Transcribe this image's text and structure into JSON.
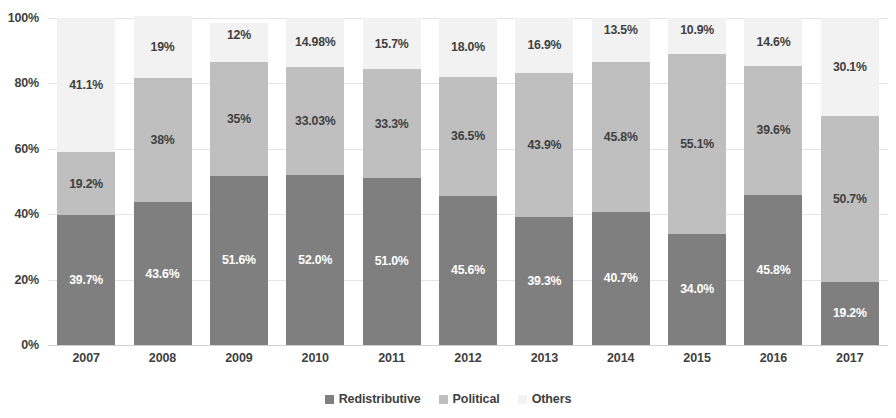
{
  "chart_data": {
    "type": "bar",
    "subtype": "100% stacked column",
    "title": "",
    "xlabel": "",
    "ylabel": "",
    "categories": [
      "2007",
      "2008",
      "2009",
      "2010",
      "2011",
      "2012",
      "2013",
      "2014",
      "2015",
      "2016",
      "2017"
    ],
    "ylim": [
      0,
      100
    ],
    "y_ticks": [
      0,
      20,
      40,
      60,
      80,
      100
    ],
    "y_tick_labels": [
      "0%",
      "20%",
      "40%",
      "60%",
      "80%",
      "100%"
    ],
    "grid": true,
    "legend_position": "bottom",
    "series": [
      {
        "name": "Redistributive",
        "color": "#7f7f7f",
        "values": [
          39.7,
          43.6,
          51.6,
          52.0,
          51.0,
          45.6,
          39.3,
          40.7,
          34.0,
          45.8,
          19.2
        ],
        "labels": [
          "39.7%",
          "43.6%",
          "51.6%",
          "52.0%",
          "51.0%",
          "45.6%",
          "39.3%",
          "40.7%",
          "34.0%",
          "45.8%",
          "19.2%"
        ]
      },
      {
        "name": "Political",
        "color": "#bfbfbf",
        "values": [
          19.2,
          38.0,
          35.0,
          33.03,
          33.3,
          36.5,
          43.9,
          45.8,
          55.1,
          39.6,
          50.7
        ],
        "labels": [
          "19.2%",
          "38%",
          "35%",
          "33.03%",
          "33.3%",
          "36.5%",
          "43.9%",
          "45.8%",
          "55.1%",
          "39.6%",
          "50.7%"
        ]
      },
      {
        "name": "Others",
        "color": "#f2f2f2",
        "values": [
          41.1,
          19.0,
          12.0,
          14.98,
          15.7,
          18.0,
          16.9,
          13.5,
          10.9,
          14.6,
          30.1
        ],
        "labels": [
          "41.1%",
          "19%",
          "12%",
          "14.98%",
          "15.7%",
          "18.0%",
          "16.9%",
          "13.5%",
          "10.9%",
          "14.6%",
          "30.1%"
        ]
      }
    ]
  },
  "legend": {
    "items": [
      {
        "label": "Redistributive",
        "color": "#7f7f7f"
      },
      {
        "label": "Political",
        "color": "#bfbfbf"
      },
      {
        "label": "Others",
        "color": "#f2f2f2"
      }
    ]
  }
}
